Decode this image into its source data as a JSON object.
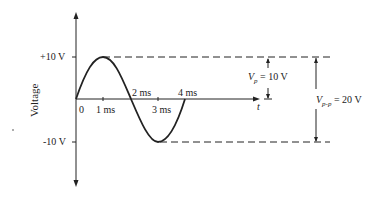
{
  "diagram": {
    "type": "sine-wave",
    "axis": {
      "y_label": "Voltage",
      "x_label": "t"
    },
    "y_ticks": [
      "+10 V",
      "-10 V"
    ],
    "x_ticks": [
      "0",
      "1 ms",
      "2 ms",
      "3 ms",
      "4 ms"
    ],
    "annotations": {
      "vp_symbol": "V",
      "vp_sub": "p",
      "vp_value": "= 10 V",
      "vpp_symbol": "V",
      "vpp_sub": "p-p",
      "vpp_value": "= 20 V"
    },
    "signal": {
      "amplitude_V": 10,
      "period_ms": 4,
      "peak_to_peak_V": 20
    }
  }
}
